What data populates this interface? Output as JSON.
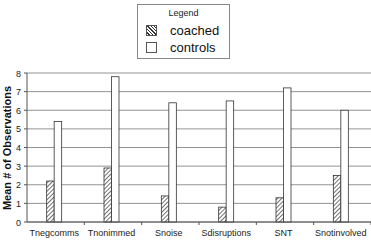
{
  "chart_data": {
    "type": "bar",
    "title": "",
    "xlabel": "",
    "ylabel": "Mean # of Observations",
    "ylim": [
      0,
      8
    ],
    "yticks": [
      0,
      1,
      2,
      3,
      4,
      5,
      6,
      7,
      8
    ],
    "grid": true,
    "legend_position": "top-center",
    "legend_title": "Legend",
    "categories": [
      "Tnegcomms",
      "Tnonimmed",
      "Snoise",
      "Sdisruptions",
      "SNT",
      "Snotinvolved"
    ],
    "series": [
      {
        "name": "coached",
        "pattern": "diagonal-hatch",
        "values": [
          2.2,
          2.9,
          1.4,
          0.8,
          1.3,
          2.5
        ]
      },
      {
        "name": "controls",
        "pattern": "white",
        "values": [
          5.4,
          7.8,
          6.4,
          6.5,
          7.2,
          6.0
        ]
      }
    ]
  },
  "legend": {
    "title": "Legend",
    "items": [
      {
        "label": "coached",
        "swatch": "hatch"
      },
      {
        "label": "controls",
        "swatch": "plain"
      }
    ]
  }
}
